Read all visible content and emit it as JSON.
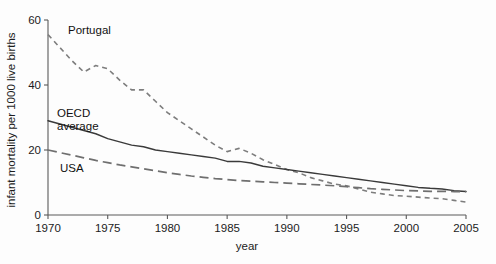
{
  "chart_data": {
    "type": "line",
    "title": "",
    "xlabel": "year",
    "ylabel": "infant mortality per 1000 live births",
    "xlim": [
      1970,
      2005
    ],
    "ylim": [
      0,
      60
    ],
    "xticks": [
      1970,
      1975,
      1980,
      1985,
      1990,
      1995,
      2000,
      2005
    ],
    "xticklabels": [
      "1970",
      "1975",
      "1980",
      "1985",
      "1990",
      "1995",
      "2000",
      "2005"
    ],
    "yticks": [
      0,
      20,
      40,
      60
    ],
    "yticklabels": [
      "0",
      "20",
      "40",
      "60"
    ],
    "grid": false,
    "legend_position": "inline-annotations",
    "x": [
      1970,
      1971,
      1972,
      1973,
      1974,
      1975,
      1976,
      1977,
      1978,
      1979,
      1980,
      1981,
      1982,
      1983,
      1984,
      1985,
      1986,
      1987,
      1988,
      1989,
      1990,
      1991,
      1992,
      1993,
      1994,
      1995,
      1996,
      1997,
      1998,
      1999,
      2000,
      2001,
      2002,
      2003,
      2004,
      2005
    ],
    "series": [
      {
        "name": "Portugal",
        "style": "dotted",
        "color": "#7d7d7d",
        "label_text": "Portugal",
        "values": [
          55.5,
          51.5,
          47.5,
          44.0,
          46.0,
          45.0,
          41.5,
          38.5,
          38.5,
          35.0,
          31.5,
          29.0,
          26.5,
          24.0,
          21.5,
          19.5,
          20.5,
          19.0,
          17.0,
          15.5,
          14.0,
          13.0,
          11.5,
          10.5,
          9.5,
          9.0,
          8.0,
          7.0,
          6.5,
          6.0,
          5.8,
          5.5,
          5.2,
          5.0,
          4.5,
          4.0
        ]
      },
      {
        "name": "OECD average",
        "style": "solid",
        "color": "#3a3a3a",
        "label_text": "OECD\naverage",
        "values": [
          29.0,
          28.0,
          27.0,
          26.0,
          25.0,
          23.5,
          22.5,
          21.5,
          21.0,
          20.0,
          19.5,
          19.0,
          18.5,
          18.0,
          17.5,
          16.5,
          16.5,
          16.0,
          15.0,
          14.5,
          14.0,
          13.5,
          13.0,
          12.5,
          12.0,
          11.5,
          11.0,
          10.5,
          10.0,
          9.5,
          9.0,
          8.5,
          8.2,
          8.0,
          7.5,
          7.2
        ]
      },
      {
        "name": "USA",
        "style": "dashed",
        "color": "#6f6f6f",
        "label_text": "USA",
        "values": [
          20.0,
          19.2,
          18.4,
          17.6,
          16.8,
          16.1,
          15.4,
          14.8,
          14.2,
          13.6,
          13.0,
          12.5,
          12.0,
          11.6,
          11.2,
          10.9,
          10.6,
          10.4,
          10.2,
          10.0,
          9.8,
          9.6,
          9.4,
          9.2,
          9.0,
          8.7,
          8.4,
          8.1,
          7.9,
          7.7,
          7.5,
          7.4,
          7.3,
          7.3,
          7.2,
          7.2
        ]
      }
    ],
    "annotations": [
      {
        "text": "Portugal",
        "series": "Portugal"
      },
      {
        "text": "OECD",
        "series": "OECD average"
      },
      {
        "text": "average",
        "series": "OECD average"
      },
      {
        "text": "USA",
        "series": "USA"
      }
    ]
  }
}
